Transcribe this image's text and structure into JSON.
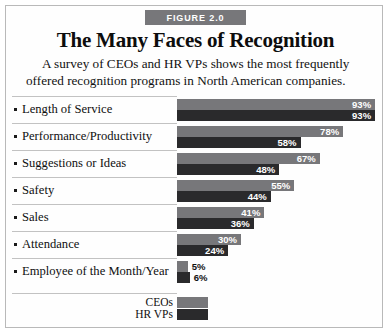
{
  "figure": {
    "badge_label": "FIGURE 2.0",
    "title": "The Many Faces of Recognition",
    "subtitle": "A survey of CEOs and HR VPs shows the most frequently offered recognition programs in North American companies."
  },
  "colors": {
    "ceo_bar": "#77777a",
    "hr_bar": "#2a2a2c",
    "badge_bg": "#77777a",
    "border": "#b9b9b9",
    "rule": "#c2c2c2",
    "text": "#0f0f0f"
  },
  "legend": {
    "items": [
      {
        "name": "CEOs",
        "color": "#77777a"
      },
      {
        "name": "HR VPs",
        "color": "#2a2a2c"
      }
    ]
  },
  "chart_data": {
    "type": "bar",
    "orientation": "horizontal",
    "title": "The Many Faces of Recognition",
    "subtitle": "A survey of CEOs and HR VPs shows the most frequently offered recognition programs in North American companies.",
    "xlabel": "",
    "ylabel": "",
    "xlim": [
      0,
      100
    ],
    "grid": false,
    "legend_position": "bottom",
    "value_suffix": "%",
    "categories": [
      "Length of Service",
      "Performance/Productivity",
      "Suggestions or Ideas",
      "Safety",
      "Sales",
      "Attendance",
      "Employee of the Month/Year"
    ],
    "series": [
      {
        "name": "CEOs",
        "color": "#77777a",
        "values": [
          93,
          78,
          67,
          55,
          41,
          30,
          5
        ],
        "labels": [
          "93%",
          "78%",
          "67%",
          "55%",
          "41%",
          "30%",
          "5%"
        ]
      },
      {
        "name": "HR VPs",
        "color": "#2a2a2c",
        "values": [
          93,
          58,
          48,
          44,
          36,
          24,
          6
        ],
        "labels": [
          "93%",
          "58%",
          "48%",
          "44%",
          "36%",
          "24%",
          "6%"
        ]
      }
    ]
  }
}
